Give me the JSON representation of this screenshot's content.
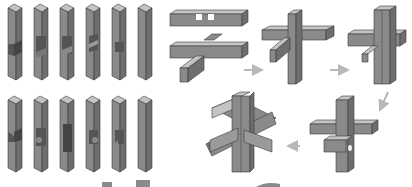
{
  "diagram": {
    "title": "",
    "colors": {
      "face_front": "#8a8a8a",
      "face_side": "#6e6e6e",
      "face_top": "#c4c4c4",
      "outline": "#3a3a3a",
      "arrow": "#b8b8b8",
      "background": "#ffffff"
    },
    "pieces_top_row": [
      {
        "id": "piece-1",
        "notch": "side-cut"
      },
      {
        "id": "piece-2",
        "notch": "double-step"
      },
      {
        "id": "piece-3",
        "notch": "double-step"
      },
      {
        "id": "piece-4",
        "notch": "v-cut"
      },
      {
        "id": "piece-5",
        "notch": "single-cut"
      },
      {
        "id": "piece-6",
        "notch": "none"
      }
    ],
    "pieces_bottom_row": [
      {
        "id": "piece-7",
        "notch": "curved-cut"
      },
      {
        "id": "piece-8",
        "notch": "step-cut"
      },
      {
        "id": "piece-9",
        "notch": "long-slot"
      },
      {
        "id": "piece-10",
        "notch": "curved-step"
      },
      {
        "id": "piece-11",
        "notch": "hook-cut"
      },
      {
        "id": "piece-12",
        "notch": "none"
      }
    ],
    "assembly_steps": [
      {
        "step": 1,
        "label": "two horizontal bars"
      },
      {
        "step": 2,
        "label": "vertical bar added"
      },
      {
        "step": 3,
        "label": "second vertical bar"
      },
      {
        "step": 4,
        "label": "cross assembled"
      },
      {
        "step": 5,
        "label": "completed burr"
      }
    ],
    "arrows": [
      "right",
      "right",
      "down-left",
      "left"
    ]
  }
}
